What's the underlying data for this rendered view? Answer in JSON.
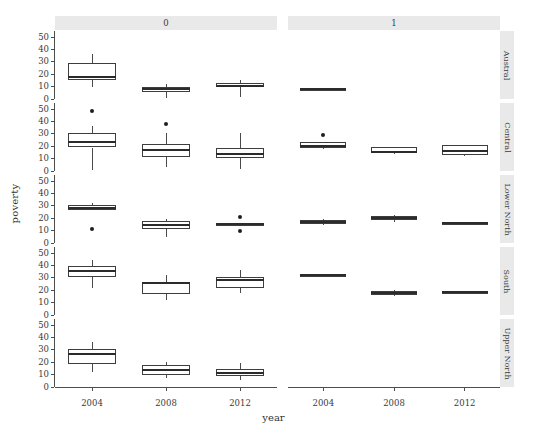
{
  "chart_data": {
    "type": "box",
    "title": "",
    "xlabel": "year",
    "ylabel": "poverty",
    "x_categories": [
      "2004",
      "2008",
      "2012"
    ],
    "y_ticks": [
      0,
      10,
      20,
      30,
      40,
      50
    ],
    "ylim": [
      0,
      55
    ],
    "grid": false,
    "legend": "none",
    "facet_col_label": "",
    "facet_row_label": "",
    "facet_cols": [
      "0",
      "1"
    ],
    "facet_rows": [
      "Austral",
      "Central",
      "Lower North",
      "South",
      "Upper North"
    ],
    "boxes": [
      {
        "row": "Austral",
        "col": "0",
        "year": "2004",
        "lower_whisker": 9.5,
        "q1": 15.5,
        "median": 18.0,
        "q3": 29.0,
        "upper_whisker": 36.0,
        "outliers": []
      },
      {
        "row": "Austral",
        "col": "0",
        "year": "2008",
        "lower_whisker": 1.0,
        "q1": 6.0,
        "median": 8.0,
        "q3": 9.5,
        "upper_whisker": 12.0,
        "outliers": []
      },
      {
        "row": "Austral",
        "col": "0",
        "year": "2012",
        "lower_whisker": 1.5,
        "q1": 9.5,
        "median": 10.5,
        "q3": 13.0,
        "upper_whisker": 15.5,
        "outliers": []
      },
      {
        "row": "Austral",
        "col": "1",
        "year": "2004",
        "lower_whisker": 8.0,
        "q1": 8.0,
        "median": 8.0,
        "q3": 8.0,
        "upper_whisker": 8.0,
        "outliers": []
      },
      {
        "row": "Central",
        "col": "0",
        "year": "2004",
        "lower_whisker": 1.0,
        "q1": 19.0,
        "median": 23.5,
        "q3": 30.5,
        "upper_whisker": 36.0,
        "outliers": [
          48.5
        ]
      },
      {
        "row": "Central",
        "col": "0",
        "year": "2008",
        "lower_whisker": 3.0,
        "q1": 11.0,
        "median": 17.0,
        "q3": 21.5,
        "upper_whisker": 31.0,
        "outliers": [
          38.0
        ]
      },
      {
        "row": "Central",
        "col": "0",
        "year": "2012",
        "lower_whisker": 1.5,
        "q1": 10.5,
        "median": 14.0,
        "q3": 19.0,
        "upper_whisker": 31.0,
        "outliers": []
      },
      {
        "row": "Central",
        "col": "1",
        "year": "2004",
        "lower_whisker": 18.0,
        "q1": 19.0,
        "median": 20.5,
        "q3": 23.5,
        "upper_whisker": 23.5,
        "outliers": [
          29.0
        ]
      },
      {
        "row": "Central",
        "col": "1",
        "year": "2008",
        "lower_whisker": 13.5,
        "q1": 14.5,
        "median": 15.5,
        "q3": 19.5,
        "upper_whisker": 19.5,
        "outliers": []
      },
      {
        "row": "Central",
        "col": "1",
        "year": "2012",
        "lower_whisker": 12.0,
        "q1": 13.0,
        "median": 16.0,
        "q3": 21.0,
        "upper_whisker": 21.0,
        "outliers": []
      },
      {
        "row": "Lower North",
        "col": "0",
        "year": "2004",
        "lower_whisker": 26.5,
        "q1": 26.5,
        "median": 28.0,
        "q3": 30.5,
        "upper_whisker": 32.0,
        "outliers": [
          11.0
        ]
      },
      {
        "row": "Lower North",
        "col": "0",
        "year": "2008",
        "lower_whisker": 5.0,
        "q1": 11.5,
        "median": 14.5,
        "q3": 17.5,
        "upper_whisker": 19.5,
        "outliers": []
      },
      {
        "row": "Lower North",
        "col": "0",
        "year": "2012",
        "lower_whisker": 15.0,
        "q1": 15.0,
        "median": 15.0,
        "q3": 15.0,
        "upper_whisker": 15.0,
        "outliers": [
          21.0,
          10.0
        ]
      },
      {
        "row": "Lower North",
        "col": "1",
        "year": "2004",
        "lower_whisker": 14.5,
        "q1": 15.5,
        "median": 17.0,
        "q3": 18.5,
        "upper_whisker": 19.5,
        "outliers": []
      },
      {
        "row": "Lower North",
        "col": "1",
        "year": "2008",
        "lower_whisker": 17.0,
        "q1": 19.0,
        "median": 20.5,
        "q3": 22.0,
        "upper_whisker": 23.0,
        "outliers": []
      },
      {
        "row": "Lower North",
        "col": "1",
        "year": "2012",
        "lower_whisker": 16.5,
        "q1": 16.5,
        "median": 16.5,
        "q3": 16.5,
        "upper_whisker": 16.5,
        "outliers": []
      },
      {
        "row": "South",
        "col": "0",
        "year": "2004",
        "lower_whisker": 21.5,
        "q1": 30.5,
        "median": 35.5,
        "q3": 40.0,
        "upper_whisker": 44.5,
        "outliers": []
      },
      {
        "row": "South",
        "col": "0",
        "year": "2008",
        "lower_whisker": 12.5,
        "q1": 17.0,
        "median": 25.5,
        "q3": 27.0,
        "upper_whisker": 32.0,
        "outliers": []
      },
      {
        "row": "South",
        "col": "0",
        "year": "2012",
        "lower_whisker": 17.5,
        "q1": 22.0,
        "median": 28.0,
        "q3": 30.5,
        "upper_whisker": 36.0,
        "outliers": []
      },
      {
        "row": "South",
        "col": "1",
        "year": "2004",
        "lower_whisker": 32.0,
        "q1": 32.0,
        "median": 32.0,
        "q3": 32.0,
        "upper_whisker": 32.0,
        "outliers": []
      },
      {
        "row": "South",
        "col": "1",
        "year": "2008",
        "lower_whisker": 15.5,
        "q1": 16.5,
        "median": 18.0,
        "q3": 19.5,
        "upper_whisker": 20.5,
        "outliers": []
      },
      {
        "row": "South",
        "col": "1",
        "year": "2012",
        "lower_whisker": 19.0,
        "q1": 19.0,
        "median": 19.0,
        "q3": 19.0,
        "upper_whisker": 19.0,
        "outliers": []
      },
      {
        "row": "Upper North",
        "col": "0",
        "year": "2004",
        "lower_whisker": 12.5,
        "q1": 19.0,
        "median": 26.5,
        "q3": 31.0,
        "upper_whisker": 36.5,
        "outliers": []
      },
      {
        "row": "Upper North",
        "col": "0",
        "year": "2008",
        "lower_whisker": 7.0,
        "q1": 9.5,
        "median": 13.5,
        "q3": 17.5,
        "upper_whisker": 20.0,
        "outliers": []
      },
      {
        "row": "Upper North",
        "col": "0",
        "year": "2012",
        "lower_whisker": 5.5,
        "q1": 9.0,
        "median": 11.5,
        "q3": 14.5,
        "upper_whisker": 19.5,
        "outliers": []
      }
    ]
  },
  "colors": {
    "box_stroke": "#3d3d3d",
    "box_fill": "#ffffff",
    "median": "#2b2b2b",
    "whisker": "#4a4a4a",
    "outlier": "#1f1f1f",
    "strip_bg": "#e9e9e9",
    "axis": "#4d4d4d",
    "text": "#3a3a3a",
    "background": "#ffffff"
  }
}
